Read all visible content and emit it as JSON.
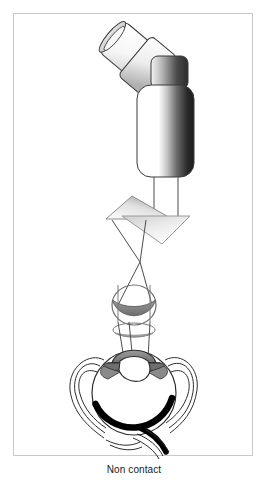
{
  "figure": {
    "caption": "Non contact",
    "frame": {
      "border_color": "#c9c9c9",
      "background": "#ffffff"
    },
    "parts": [
      {
        "id": "eyepiece-tube",
        "label": "eyepiece-tube"
      },
      {
        "id": "eyepiece-collar",
        "label": "eyepiece-collar"
      },
      {
        "id": "instrument-body",
        "label": "instrument-body"
      },
      {
        "id": "instrument-shaft",
        "label": "instrument-shaft"
      },
      {
        "id": "prism-upper",
        "label": "prism-upper"
      },
      {
        "id": "prism-lower",
        "label": "prism-lower"
      },
      {
        "id": "light-rays",
        "label": "light-rays"
      },
      {
        "id": "objective-lens",
        "label": "objective-lens"
      },
      {
        "id": "eye-cross-section",
        "label": "eye-cross-section"
      },
      {
        "id": "cornea",
        "label": "cornea"
      },
      {
        "id": "iris",
        "label": "iris"
      },
      {
        "id": "crystalline-lens",
        "label": "crystalline-lens"
      },
      {
        "id": "retina",
        "label": "retina"
      },
      {
        "id": "optic-nerve",
        "label": "optic-nerve"
      }
    ],
    "colors": {
      "outline": "#3a3a3a",
      "body_dark": "#1c1c1c",
      "body_light": "#ffffff",
      "cornea_gray": "#8a8a8a",
      "iris_gray": "#707070",
      "retina_black": "#000000",
      "ray_gray": "#4a4a4a",
      "prism_fill_light": "#f2f2f2",
      "prism_fill_dark": "#9a9a9a"
    }
  }
}
